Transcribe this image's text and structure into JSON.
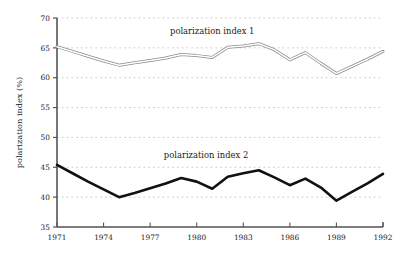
{
  "chart_data": {
    "type": "line",
    "title": "",
    "subtitle": "",
    "xlabel": "",
    "ylabel": "polarization index (%)",
    "xlim": [
      1971,
      1992
    ],
    "ylim": [
      35,
      70
    ],
    "yticks": [
      35,
      40,
      45,
      50,
      55,
      60,
      65,
      70
    ],
    "ytick_labels": [
      "35",
      "40",
      "45",
      "50",
      "55",
      "60",
      "65",
      "70"
    ],
    "xticks": [
      1971,
      1974,
      1977,
      1980,
      1983,
      1986,
      1989,
      1992
    ],
    "xtick_labels": [
      "1971",
      "1974",
      "1977",
      "1980",
      "1983",
      "1986",
      "1989",
      "1992"
    ],
    "grid": "horizontal-dotted",
    "legend_position": "inline-annotation",
    "x": [
      1971,
      1972,
      1973,
      1974,
      1975,
      1976,
      1977,
      1978,
      1979,
      1980,
      1981,
      1982,
      1983,
      1984,
      1985,
      1986,
      1987,
      1988,
      1989,
      1990,
      1991,
      1992
    ],
    "series": [
      {
        "name": "polarization index 1",
        "style": "double-outline-gray",
        "color": "#8a8a8a",
        "annotation": "polarization index 1",
        "annotation_x": 1981.0,
        "annotation_y": 67.4,
        "values": [
          65.2,
          64.4,
          63.6,
          62.8,
          62.1,
          62.5,
          62.9,
          63.3,
          63.9,
          63.7,
          63.4,
          65.1,
          65.3,
          65.7,
          64.7,
          63.0,
          64.2,
          62.4,
          60.7,
          61.9,
          63.1,
          64.4
        ]
      },
      {
        "name": "polarization index 2",
        "style": "thick-black",
        "color": "#111111",
        "annotation": "polarization index 2",
        "annotation_x": 1980.6,
        "annotation_y": 46.5,
        "values": [
          45.4,
          44.0,
          42.6,
          41.3,
          40.0,
          40.7,
          41.5,
          42.3,
          43.2,
          42.6,
          41.4,
          43.4,
          44.0,
          44.5,
          43.3,
          42.0,
          43.1,
          41.6,
          39.4,
          40.9,
          42.3,
          43.9
        ]
      }
    ],
    "axis_color": "#555555",
    "grid_color": "#b9b9b9",
    "background": "#ffffff"
  },
  "geometry": {
    "plot_left": 57,
    "plot_right": 383,
    "plot_top": 18,
    "plot_bottom": 227
  }
}
